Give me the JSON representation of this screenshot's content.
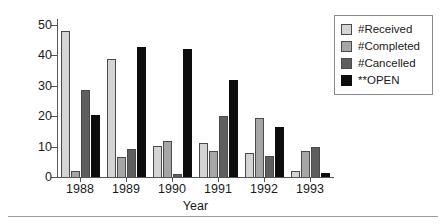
{
  "chart_data": {
    "type": "bar",
    "title": "",
    "subtitle": "",
    "xlabel": "Year",
    "ylabel": "",
    "categories": [
      "1988",
      "1989",
      "1990",
      "1991",
      "1992",
      "1993"
    ],
    "series": [
      {
        "name": "#Received",
        "color": "#d4d4d4",
        "values": [
          48,
          39,
          10.3,
          11.3,
          7.8,
          2.0
        ]
      },
      {
        "name": "#Completed",
        "color": "#a6a6a6",
        "values": [
          2,
          6.5,
          11.8,
          8.5,
          19.5,
          8.5
        ]
      },
      {
        "name": "#Cancelled",
        "color": "#5e5e5e",
        "values": [
          28.5,
          9.3,
          1.0,
          20,
          7.0,
          9.8
        ]
      },
      {
        "name": "**OPEN",
        "color": "#0d0d0d",
        "values": [
          20.5,
          42.7,
          42,
          31.8,
          16.3,
          1.3
        ]
      }
    ],
    "ylim": [
      0,
      52
    ],
    "yticks": [
      0,
      10,
      20,
      30,
      40,
      50
    ],
    "ytick_labels": [
      "0",
      "10",
      "20",
      "30",
      "40",
      "50"
    ],
    "grid": false,
    "legend_position": "top-right"
  },
  "legend": {
    "entries": [
      {
        "label": "#Received"
      },
      {
        "label": "#Completed"
      },
      {
        "label": "#Cancelled"
      },
      {
        "label": "**OPEN"
      }
    ]
  }
}
